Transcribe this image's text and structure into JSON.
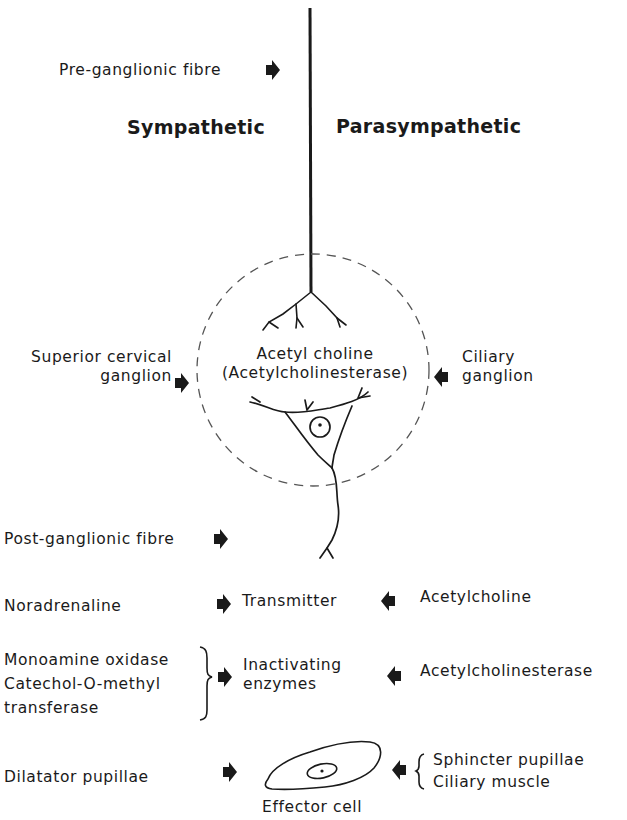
{
  "headings": {
    "sympathetic": "Sympathetic",
    "parasympathetic": "Parasympathetic"
  },
  "labels": {
    "pre_ganglionic": "Pre-ganglionic fibre",
    "superior_cervical_1": "Superior cervical",
    "superior_cervical_2": "ganglion",
    "ciliary_ganglion_1": "Ciliary",
    "ciliary_ganglion_2": "ganglion",
    "synapse_1": "Acetyl choline",
    "synapse_2": "(Acetylcholinesterase)",
    "post_ganglionic": "Post-ganglionic fibre"
  },
  "rows": {
    "transmitter": {
      "left": "Noradrenaline",
      "center": "Transmitter",
      "right": "Acetylcholine"
    },
    "enzymes": {
      "left": [
        "Monoamine oxidase",
        "Catechol-O-methyl",
        "transferase"
      ],
      "center": [
        "Inactivating",
        "enzymes"
      ],
      "right": "Acetylcholinesterase"
    },
    "effector": {
      "left": "Dilatator pupillae",
      "center": "Effector cell",
      "right": [
        "Sphincter pupillae",
        "Ciliary muscle"
      ]
    }
  },
  "colors": {
    "ink": "#1a1a1a",
    "dashed_circle": "#555555",
    "background": "#ffffff"
  }
}
